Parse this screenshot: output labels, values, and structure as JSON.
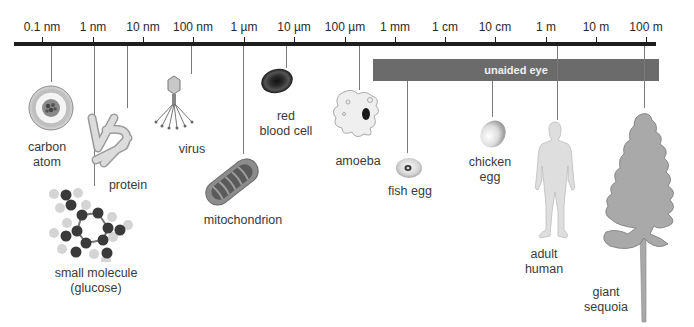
{
  "scale": {
    "ticks": [
      {
        "label": "0.1 nm",
        "x": 42
      },
      {
        "label": "1 nm",
        "x": 93
      },
      {
        "label": "10 nm",
        "x": 143
      },
      {
        "label": "100 nm",
        "x": 193
      },
      {
        "label": "1 µm",
        "x": 244
      },
      {
        "label": "10 µm",
        "x": 294
      },
      {
        "label": "100 µm",
        "x": 345
      },
      {
        "label": "1 mm",
        "x": 395
      },
      {
        "label": "1 cm",
        "x": 445
      },
      {
        "label": "10 cm",
        "x": 495
      },
      {
        "label": "1 m",
        "x": 546
      },
      {
        "label": "10 m",
        "x": 596
      },
      {
        "label": "100 m",
        "x": 646
      }
    ],
    "range_bar": {
      "label": "unaided eye",
      "color": "#6b6b6b"
    }
  },
  "objects": [
    {
      "name": "carbon",
      "line2": "atom"
    },
    {
      "name": "protein"
    },
    {
      "name": "small molecule",
      "line2": "(glucose)"
    },
    {
      "name": "virus"
    },
    {
      "name": "mitochondrion"
    },
    {
      "name": "red",
      "line2": "blood cell"
    },
    {
      "name": "amoeba"
    },
    {
      "name": "fish egg"
    },
    {
      "name": "chicken",
      "line2": "egg"
    },
    {
      "name": "adult",
      "line2": "human"
    },
    {
      "name": "giant",
      "line2": "sequoia"
    }
  ]
}
